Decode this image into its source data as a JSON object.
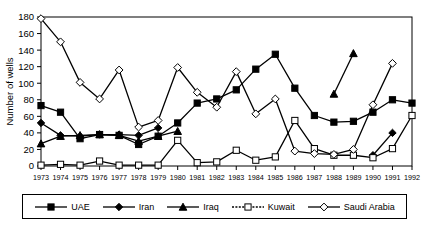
{
  "chart_data": {
    "type": "line",
    "title": "",
    "xlabel": "",
    "ylabel": "Number of wells",
    "ylim": [
      0,
      180
    ],
    "ytick_step": 20,
    "yticks": [
      0,
      20,
      40,
      60,
      80,
      100,
      120,
      140,
      160,
      180
    ],
    "grid": false,
    "legend_position": "bottom",
    "categories": [
      "1973",
      "1974",
      "1975",
      "1976",
      "1977",
      "1978",
      "1979",
      "1980",
      "1981",
      "1982",
      "1983",
      "1984",
      "1985",
      "1986",
      "1987",
      "1988",
      "1989",
      "1990",
      "1991",
      "1992"
    ],
    "series": [
      {
        "name": "UAE",
        "marker": "filled-square",
        "color": "#000000",
        "values": [
          73,
          65,
          33,
          38,
          37,
          26,
          36,
          52,
          76,
          81,
          92,
          117,
          135,
          94,
          61,
          53,
          54,
          65,
          80,
          76
        ]
      },
      {
        "name": "Iran",
        "marker": "filled-diamond",
        "color": "#000000",
        "values": [
          52,
          37,
          36,
          38,
          38,
          37,
          46,
          null,
          null,
          null,
          null,
          null,
          null,
          null,
          null,
          null,
          null,
          13,
          40,
          null
        ]
      },
      {
        "name": "Iraq",
        "marker": "filled-triangle",
        "color": "#000000",
        "values": [
          27,
          36,
          37,
          38,
          37,
          30,
          36,
          42,
          null,
          null,
          null,
          null,
          null,
          null,
          null,
          87,
          136,
          null,
          null,
          null
        ]
      },
      {
        "name": "Kuwait",
        "marker": "open-square",
        "color": "#000000",
        "values": [
          1,
          2,
          1,
          6,
          1,
          1,
          1,
          31,
          4,
          5,
          19,
          7,
          11,
          55,
          21,
          13,
          13,
          10,
          21,
          61
        ]
      },
      {
        "name": "Saudi Arabia",
        "marker": "open-diamond",
        "color": "#000000",
        "values": [
          178,
          150,
          101,
          81,
          116,
          47,
          55,
          119,
          89,
          71,
          114,
          63,
          81,
          18,
          15,
          14,
          20,
          74,
          124,
          null
        ]
      }
    ]
  },
  "axis": {
    "y_title": "Number of wells"
  },
  "legend": {
    "items": [
      {
        "label": "UAE",
        "marker": "filled-square"
      },
      {
        "label": "Iran",
        "marker": "filled-diamond"
      },
      {
        "label": "Iraq",
        "marker": "filled-triangle"
      },
      {
        "label": "Kuwait",
        "marker": "open-square"
      },
      {
        "label": "Saudi Arabia",
        "marker": "open-diamond"
      }
    ]
  }
}
